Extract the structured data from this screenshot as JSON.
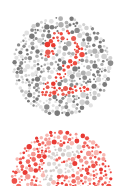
{
  "plates": [
    {
      "name": "Ishihara plate showing 2",
      "digit": "2",
      "background_dot_colors": [
        "#7a7a7a",
        "#8c8c8c",
        "#b0b0b0",
        "#d2d2d2",
        "#e2e2e2"
      ],
      "figure_dot_colors": [
        "#e8392f",
        "#f04a3e",
        "#e85a50"
      ],
      "center": [
        62,
        66
      ],
      "radius": 49
    },
    {
      "name": "Ishihara plate showing 6 (partially visible)",
      "digit": "6",
      "background_dot_colors": [
        "#e83a34",
        "#f26a62",
        "#f49a94",
        "#f7b8b2",
        "#ee5048"
      ],
      "figure_dot_colors": [
        "#d8d2d0",
        "#e0dcda",
        "#cfc8c6"
      ],
      "center": [
        62,
        181
      ],
      "radius": 50
    }
  ]
}
